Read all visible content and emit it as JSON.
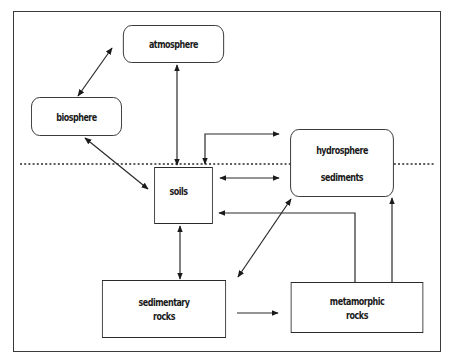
{
  "diagram": {
    "type": "flow-cycle",
    "nodes": {
      "atmosphere": {
        "label": "atmosphere",
        "shape": "rounded-rect"
      },
      "biosphere": {
        "label": "biosphere",
        "shape": "rounded-rect"
      },
      "hydrosphere": {
        "label_top": "hydrosphere",
        "label_bottom": "sediments",
        "shape": "rounded-rect"
      },
      "soils": {
        "label": "soils",
        "shape": "rect"
      },
      "sedimentary_rocks": {
        "line1": "sedimentary",
        "line2": "rocks",
        "shape": "rect"
      },
      "metamorphic_rocks": {
        "line1": "metamorphic",
        "line2": "rocks",
        "shape": "rect"
      }
    },
    "edges": [
      {
        "from": "biosphere",
        "to": "atmosphere",
        "direction": "both"
      },
      {
        "from": "atmosphere",
        "to": "soils",
        "direction": "both"
      },
      {
        "from": "biosphere",
        "to": "soils",
        "direction": "both"
      },
      {
        "from": "soils",
        "to": "hydrosphere",
        "direction": "both",
        "route": "loop-above"
      },
      {
        "from": "soils",
        "to": "hydrosphere",
        "direction": "both"
      },
      {
        "from": "soils",
        "to": "sedimentary_rocks",
        "direction": "both"
      },
      {
        "from": "sedimentary_rocks",
        "to": "hydrosphere",
        "direction": "both"
      },
      {
        "from": "sedimentary_rocks",
        "to": "metamorphic_rocks",
        "direction": "forward"
      },
      {
        "from": "metamorphic_rocks",
        "to": "soils",
        "direction": "forward"
      },
      {
        "from": "metamorphic_rocks",
        "to": "hydrosphere",
        "direction": "forward"
      }
    ],
    "divider": {
      "style": "dotted",
      "meaning": "surface boundary"
    },
    "colors": {
      "line": "#2a2a2a",
      "background": "#ffffff",
      "frame": "#3a3a3a"
    }
  }
}
